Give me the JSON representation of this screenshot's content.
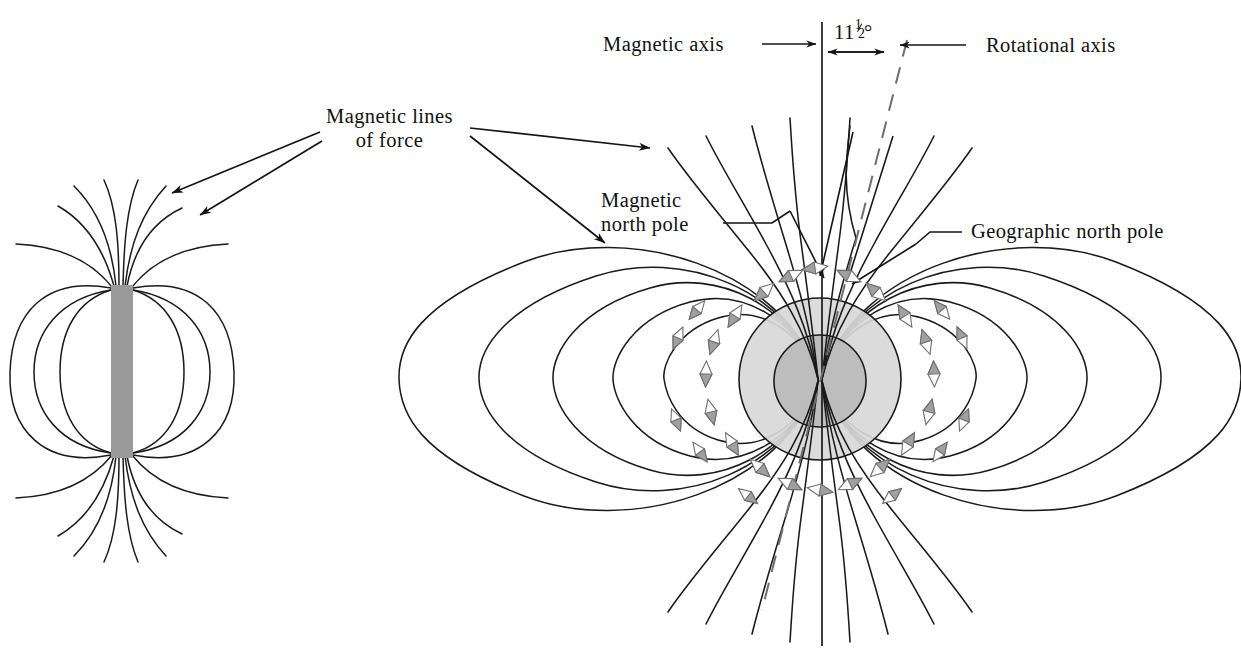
{
  "figure": {
    "background_color": "#ffffff",
    "line_color": "#1a1a1a",
    "magnet_fill": "#9a9a9a",
    "earth_outer_fill": "#d8d8d8",
    "earth_core_fill": "#bcbcbc",
    "compass_fill": "#a8a8a8",
    "compass_white": "#fdfdfd"
  },
  "labels": {
    "magnetic_lines_of_force_line1": "Magnetic lines",
    "magnetic_lines_of_force_line2": "of force",
    "magnetic_axis": "Magnetic axis",
    "rotational_axis": "Rotational axis",
    "tilt_angle_whole": "11",
    "tilt_angle_numerator": "1",
    "tilt_angle_denominator": "2",
    "tilt_angle_degree": "°",
    "tilt_angle_full": "11½°",
    "magnetic_north_pole_line1": "Magnetic",
    "magnetic_north_pole_line2": "north pole",
    "geographic_north_pole": "Geographic north pole"
  },
  "panels": {
    "left": {
      "name": "bar-magnet-panel",
      "object": "bar-magnet",
      "magnet_x": 111,
      "magnet_y": 285,
      "magnet_width": 22,
      "magnet_height": 173,
      "field_line_count": 14
    },
    "right": {
      "name": "earth-dipole-panel",
      "object": "earth-globe",
      "center_x": 820,
      "center_y": 379,
      "outer_radius": 81,
      "core_radius": 46,
      "field_line_count": 18,
      "compass_needle_count": 26,
      "magnetic_axis_type": "solid",
      "rotational_axis_type": "dashed"
    }
  },
  "icons": {
    "arrowhead": "arrowhead-icon",
    "compass_needle": "compass-needle-icon",
    "dashed_line": "dashed-line-icon"
  }
}
